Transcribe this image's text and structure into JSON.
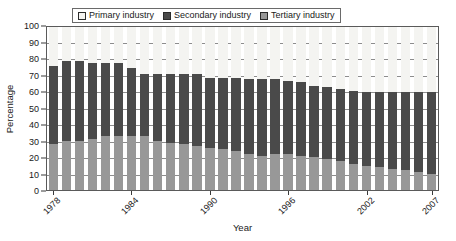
{
  "chart_data": {
    "type": "bar",
    "subtype": "stacked-bar-100",
    "title": "",
    "xlabel": "Year",
    "ylabel": "Percentage",
    "ylim": [
      0,
      100
    ],
    "ytick_step": 10,
    "yticks": [
      0,
      10,
      20,
      30,
      40,
      50,
      60,
      70,
      80,
      90,
      100
    ],
    "grid": true,
    "legend_position": "top",
    "legend_entries": [
      "Primary industry",
      "Secondary industry",
      "Tertiary industry"
    ],
    "colors": {
      "primary": "#f4f4f1",
      "secondary": "#4a4a4a",
      "tertiary": "#989898",
      "axis": "#3a3a3a",
      "grid": "#8d8d8d"
    },
    "categories": [
      "1978",
      "1979",
      "1980",
      "1981",
      "1982",
      "1983",
      "1984",
      "1985",
      "1986",
      "1987",
      "1988",
      "1989",
      "1990",
      "1991",
      "1992",
      "1993",
      "1994",
      "1995",
      "1996",
      "1997",
      "1998",
      "1999",
      "2000",
      "2001",
      "2002",
      "2003",
      "2004",
      "2005",
      "2006",
      "2007"
    ],
    "xtick_labels": [
      "1978",
      "1984",
      "1990",
      "1996",
      "2002",
      "2007"
    ],
    "series": [
      {
        "name": "Tertiary industry",
        "color": "#989898",
        "values": [
          28,
          30,
          30,
          31,
          33,
          33,
          33,
          33,
          30,
          29,
          28,
          27,
          26,
          25,
          24,
          22,
          21,
          22,
          22,
          21,
          20,
          19,
          18,
          16,
          15,
          14,
          13,
          12,
          11,
          10
        ]
      },
      {
        "name": "Secondary industry",
        "color": "#4a4a4a",
        "values": [
          48,
          49,
          49,
          47,
          45,
          45,
          42,
          38,
          41,
          42,
          43,
          44,
          43,
          44,
          45,
          46,
          47,
          46,
          45,
          45,
          44,
          44,
          44,
          45,
          45,
          46,
          47,
          48,
          49,
          50
        ]
      },
      {
        "name": "Primary industry",
        "color": "#f4f4f1",
        "values": [
          24,
          21,
          21,
          22,
          22,
          22,
          25,
          29,
          29,
          29,
          29,
          29,
          31,
          31,
          31,
          32,
          32,
          32,
          33,
          34,
          36,
          37,
          38,
          39,
          40,
          40,
          40,
          40,
          40,
          40
        ]
      }
    ],
    "stack_tops": {
      "tertiary_top": [
        28,
        30,
        30,
        31,
        33,
        33,
        33,
        33,
        30,
        29,
        28,
        27,
        26,
        25,
        24,
        22,
        21,
        22,
        22,
        21,
        20,
        19,
        18,
        16,
        15,
        14,
        13,
        12,
        11,
        10
      ],
      "secondary_top": [
        76,
        79,
        79,
        78,
        78,
        78,
        75,
        71,
        71,
        71,
        71,
        71,
        69,
        69,
        69,
        68,
        68,
        68,
        67,
        66,
        64,
        63,
        62,
        61,
        60,
        60,
        60,
        60,
        60,
        60
      ]
    }
  }
}
